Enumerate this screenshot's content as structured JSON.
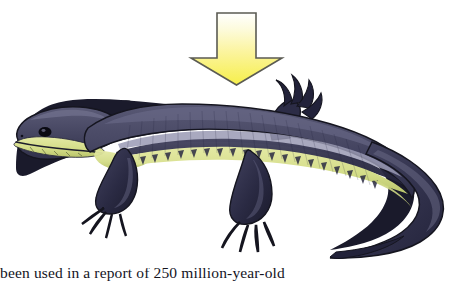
{
  "page": {
    "background_color": "#ffffff",
    "width": 473,
    "height": 281
  },
  "figure": {
    "name": "salamander-illustration",
    "arrow": {
      "name": "down-arrow",
      "direction": "down",
      "fill_top_color": "#fdfdf0",
      "fill_bottom_color": "#f5ef4e",
      "outline_color": "#5b5b53"
    },
    "animal": {
      "name": "salamander",
      "facing": "left",
      "body_dark_color": "#31314b",
      "body_mid_color": "#4b4b68",
      "body_highlight_color": "#8e8ea8",
      "belly_color": "#d9e08f",
      "belly_shadow_color": "#b9c46a",
      "outline_color": "#15151f",
      "eye_color": "#0a0a10"
    }
  },
  "caption": {
    "text": "been used in a report of 250 million-year-old"
  }
}
